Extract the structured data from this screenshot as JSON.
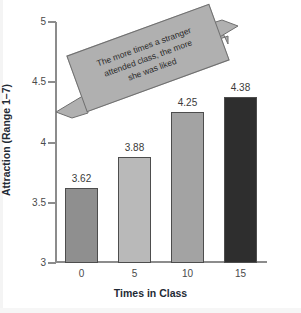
{
  "chart_data": {
    "type": "bar",
    "title": "",
    "xlabel": "Times in Class",
    "ylabel": "Attraction (Range 1–7)",
    "categories": [
      "0",
      "5",
      "10",
      "15"
    ],
    "values": [
      3.62,
      3.88,
      4.25,
      4.38
    ],
    "value_labels": [
      "3.62",
      "3.88",
      "4.25",
      "4.38"
    ],
    "ylim": [
      3,
      5
    ],
    "yticks": [
      "3",
      "3.5",
      "4",
      "4.5",
      "5"
    ],
    "ytick_values": [
      3,
      3.5,
      4,
      4.5,
      5
    ],
    "grid": false,
    "legend": null,
    "bar_colors": [
      "#8f8f8f",
      "#b9b9b9",
      "#a3a3a3",
      "#2e2e2e"
    ],
    "annotations": [
      {
        "name": "callout-banner",
        "lines": [
          "The more times a stranger",
          "attended class, the more",
          "she was liked"
        ],
        "text": "The more times a stranger attended class, the more she was liked",
        "shape": "rotated-box-with-double-arrow",
        "fill": "#b0b0b0",
        "border": "#6f6f6f"
      }
    ]
  },
  "figure": {
    "background": "#ffffff",
    "axis_color": "#8c8c8c",
    "label_color": "#1f2a35"
  }
}
